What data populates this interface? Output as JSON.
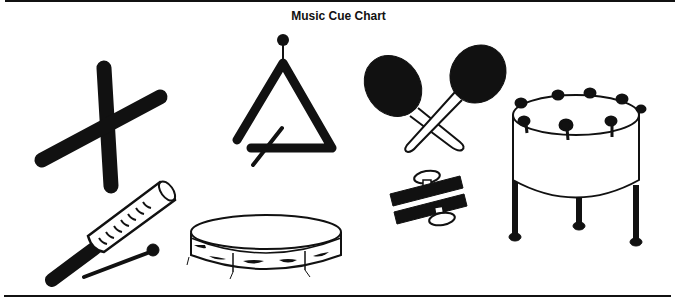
{
  "title": "Music Cue Chart",
  "colors": {
    "ink": "#111111",
    "paper": "#ffffff"
  },
  "instruments": [
    {
      "id": "rhythm-sticks",
      "icon": "crossed-sticks-icon"
    },
    {
      "id": "triangle",
      "icon": "triangle-icon"
    },
    {
      "id": "maracas",
      "icon": "maracas-icon"
    },
    {
      "id": "steel-drum",
      "icon": "steel-drum-icon"
    },
    {
      "id": "guiro",
      "icon": "guiro-icon"
    },
    {
      "id": "tambourine",
      "icon": "tambourine-icon"
    },
    {
      "id": "wood-block-clappers",
      "icon": "clapper-icon"
    }
  ]
}
